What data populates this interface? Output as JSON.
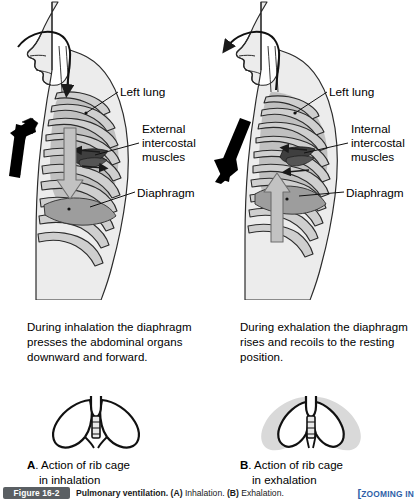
{
  "figure": {
    "number_badge": "Figure 16-2",
    "caption_bold_1": "Pulmonary ventilation.",
    "caption_a_label": "(A)",
    "caption_a_text": "Inhalation.",
    "caption_b_label": "(B)",
    "caption_b_text": "Exhalation.",
    "zooming_in_tag": "ZOOMING IN"
  },
  "panel_a": {
    "id": "A",
    "phase": "inhalation",
    "labels": {
      "left_lung": "Left lung",
      "intercostal_muscles": "External\nintercostal\nmuscles",
      "diaphragm": "Diaphragm"
    },
    "description": "During inhalation the diaphragm presses the abdominal organs downward and forward.",
    "caption_letter": "A",
    "caption_line1": ". Action of rib cage",
    "caption_line2": "in inhalation",
    "airflow_direction": "in",
    "ribcage_arrow_direction": "up",
    "diaphragm_arrow_direction": "down"
  },
  "panel_b": {
    "id": "B",
    "phase": "exhalation",
    "labels": {
      "left_lung": "Left lung",
      "intercostal_muscles": "Internal\nintercostal\nmuscles",
      "diaphragm": "Diaphragm"
    },
    "description": "During exhalation the diaphragm rises and recoils to the resting position.",
    "caption_letter": "B",
    "caption_line1": ". Action of rib cage",
    "caption_line2": "in exhalation",
    "airflow_direction": "out",
    "ribcage_arrow_direction": "down",
    "diaphragm_arrow_direction": "up"
  },
  "colors": {
    "body_fill": "#ececec",
    "rib_fill": "#c9c9c9",
    "lung_fill": "#a8a8a8",
    "diaphragm_fill": "#9a9a9a",
    "muscle_dark": "#4a4a4a",
    "outline": "#1a1a1a",
    "gray_arrow": "#b4b4b4",
    "black_arrow": "#000000",
    "badge_bg": "#5a5f63",
    "zooming_blue": "#2f5fa8"
  }
}
